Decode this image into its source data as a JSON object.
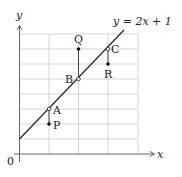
{
  "diagram": {
    "line_label": "y = 2x + 1",
    "axes": {
      "x_label": "x",
      "y_label": "y",
      "origin_label": "0"
    },
    "grid": {
      "x_range": [
        0,
        4
      ],
      "y_range": [
        0,
        8
      ],
      "x_step": 1,
      "y_step": 1
    },
    "line": {
      "slope": 2,
      "intercept": 1
    },
    "points_on_line": [
      {
        "label": "A",
        "x": 1,
        "y": 3
      },
      {
        "label": "B",
        "x": 2,
        "y": 5
      },
      {
        "label": "C",
        "x": 3,
        "y": 7
      }
    ],
    "data_points": [
      {
        "label": "P",
        "x": 1,
        "y": 2
      },
      {
        "label": "Q",
        "x": 2,
        "y": 7
      },
      {
        "label": "R",
        "x": 3,
        "y": 6
      }
    ],
    "colors": {
      "grid": "#cccccc",
      "axis": "#555555",
      "line": "#222222",
      "points": "#111111"
    }
  }
}
